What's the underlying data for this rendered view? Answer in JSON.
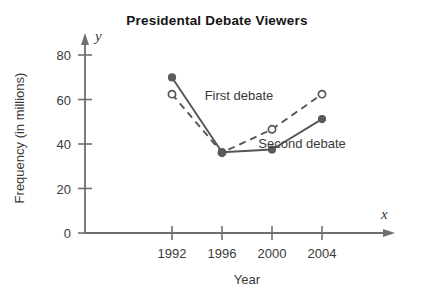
{
  "chart_data": {
    "type": "line",
    "title": "Presidental  Debate Viewers",
    "xlabel": "Year",
    "ylabel": "Frequency (in millions)",
    "x_axis_variable": "x",
    "y_axis_variable": "y",
    "categories": [
      "1992",
      "1996",
      "2000",
      "2004"
    ],
    "x": [
      1992,
      1996,
      2000,
      2004
    ],
    "xlim": [
      1990,
      2006
    ],
    "ylim": [
      0,
      88
    ],
    "y_ticks": [
      0,
      20,
      40,
      60,
      80
    ],
    "y_tick_labels": [
      "0",
      "20",
      "40",
      "60",
      "80"
    ],
    "grid": false,
    "legend_position": "inline-annotation",
    "series": [
      {
        "name": "First debate",
        "values": [
          62.4,
          36.1,
          46.6,
          62.4
        ],
        "marker": "open-circle",
        "line_style": "dashed",
        "color": "#4a4a4a"
      },
      {
        "name": "Second debate",
        "values": [
          69.9,
          36.3,
          37.5,
          51.2
        ],
        "marker": "filled-circle",
        "line_style": "solid",
        "color": "#4a4a4a"
      }
    ],
    "annotations": [
      {
        "text": "First debate",
        "x": 239,
        "y": 100
      },
      {
        "text": "Second debate",
        "x": 302,
        "y": 148
      }
    ]
  },
  "colors": {
    "axis": "#6e6e6e",
    "line": "#555555",
    "marker_fill": "#5a5a5a",
    "marker_open_fill": "#ffffff",
    "text": "#3a3a3a",
    "title": "#141414",
    "background": "#ffffff"
  },
  "geometry": {
    "plot_left": 85,
    "plot_bottom": 233,
    "plot_right": 386,
    "plot_top": 42,
    "x_positions": [
      172,
      222,
      272,
      322
    ],
    "y_zero": 233,
    "y_unit_px": 2.225
  }
}
